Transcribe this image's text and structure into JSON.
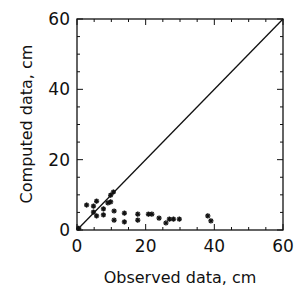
{
  "chart_data": {
    "type": "scatter",
    "title": "",
    "xlabel": "Observed data, cm",
    "ylabel": "Computed data, cm",
    "xlim": [
      0,
      60
    ],
    "ylim": [
      0,
      60
    ],
    "x_ticks": [
      0,
      20,
      40,
      60
    ],
    "y_ticks": [
      0,
      20,
      40,
      60
    ],
    "x_tick_labels": [
      "0",
      "20",
      "40",
      "60"
    ],
    "y_tick_labels": [
      "0",
      "20",
      "40",
      "60"
    ],
    "grid": false,
    "legend": null,
    "marker": "asterisk",
    "reference_line": {
      "label": "1:1 line",
      "from": [
        0,
        0
      ],
      "to": [
        60,
        60
      ]
    },
    "series": [
      {
        "name": "data",
        "points": [
          [
            2.8,
            7.1
          ],
          [
            4.8,
            6.8
          ],
          [
            5.7,
            8.2
          ],
          [
            4.8,
            5.1
          ],
          [
            5.7,
            4.0
          ],
          [
            7.7,
            6.0
          ],
          [
            7.7,
            4.3
          ],
          [
            9.0,
            7.7
          ],
          [
            9.8,
            8.0
          ],
          [
            9.8,
            9.9
          ],
          [
            10.6,
            10.8
          ],
          [
            10.8,
            5.4
          ],
          [
            10.8,
            2.8
          ],
          [
            13.8,
            4.8
          ],
          [
            13.8,
            2.3
          ],
          [
            17.7,
            4.5
          ],
          [
            17.7,
            2.8
          ],
          [
            20.8,
            4.5
          ],
          [
            21.8,
            4.5
          ],
          [
            23.9,
            3.4
          ],
          [
            25.9,
            2.0
          ],
          [
            26.9,
            3.1
          ],
          [
            28.1,
            3.1
          ],
          [
            29.8,
            3.1
          ],
          [
            38.1,
            4.0
          ],
          [
            39.0,
            2.6
          ],
          [
            0.5,
            0.5
          ]
        ]
      }
    ]
  },
  "colors": {
    "ink": "#111111",
    "background": "#ffffff"
  }
}
